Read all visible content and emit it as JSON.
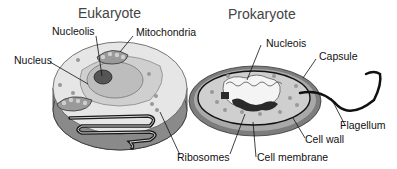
{
  "diagram": {
    "colors": {
      "cytoplasm": "#e4e4e4",
      "cell_side": "#8a8a8a",
      "organelle": "#bdbdbd",
      "outline": "#1a1a1a",
      "capsule": "#7d7d7d",
      "cell_wall": "#a9a9a9",
      "ribosome": "#999999"
    },
    "eukaryote": {
      "title": "Eukaryote",
      "labels": {
        "nucleolis": "Nucleolis",
        "mitochondria": "Mitochondria",
        "nucleus": "Nucleus",
        "ribosomes": "Ribosomes"
      }
    },
    "prokaryote": {
      "title": "Prokaryote",
      "labels": {
        "nucleois": "Nucleois",
        "capsule": "Capsule",
        "flagellum": "Flagellum",
        "cell_wall": "Cell wall",
        "cell_membrane": "Cell membrane"
      }
    }
  }
}
